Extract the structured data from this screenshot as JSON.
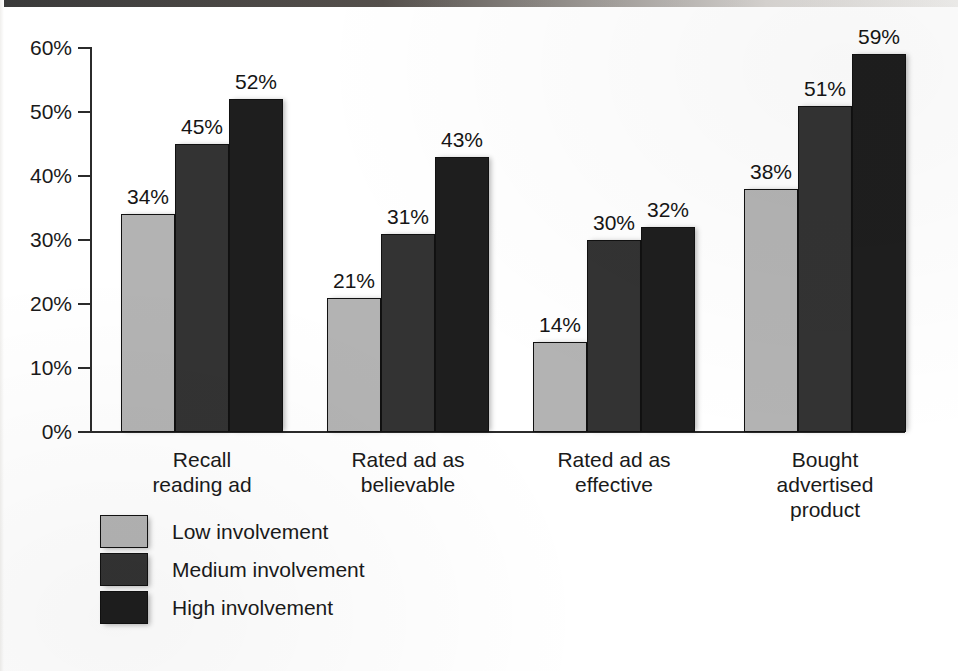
{
  "chart_data": {
    "type": "bar",
    "title": "",
    "subtitle": "",
    "xlabel": "",
    "ylabel": "",
    "ylim": [
      0,
      60
    ],
    "ytick_labels": [
      "60%",
      "50%",
      "40%",
      "30%",
      "20%",
      "10%",
      "0%"
    ],
    "ytick_values": [
      60,
      50,
      40,
      30,
      20,
      10,
      0
    ],
    "grid": false,
    "legend_position": "bottom-left",
    "categories": [
      "Recall\nreading ad",
      "Rated ad as\nbelievable",
      "Rated ad as\neffective",
      "Bought\nadvertised\nproduct"
    ],
    "series": [
      {
        "name": "Low involvement",
        "color": "#b3b3b3",
        "values": [
          34,
          21,
          14,
          38
        ],
        "labels": [
          "34%",
          "21%",
          "14%",
          "38%"
        ]
      },
      {
        "name": "Medium involvement",
        "color": "#333333",
        "values": [
          45,
          31,
          30,
          51
        ],
        "labels": [
          "45%",
          "31%",
          "30%",
          "51%"
        ]
      },
      {
        "name": "High involvement",
        "color": "#1e1e1e",
        "values": [
          52,
          43,
          32,
          59
        ],
        "labels": [
          "52%",
          "43%",
          "32%",
          "59%"
        ]
      }
    ]
  },
  "legend": {
    "items": [
      {
        "label": "Low involvement",
        "color": "#b3b3b3",
        "key": "low"
      },
      {
        "label": "Medium involvement",
        "color": "#333333",
        "key": "medium"
      },
      {
        "label": "High involvement",
        "color": "#1e1e1e",
        "key": "high"
      }
    ]
  },
  "axis": {
    "y_labels": [
      "60%",
      "50%",
      "40%",
      "30%",
      "20%",
      "10%",
      "0%"
    ]
  }
}
